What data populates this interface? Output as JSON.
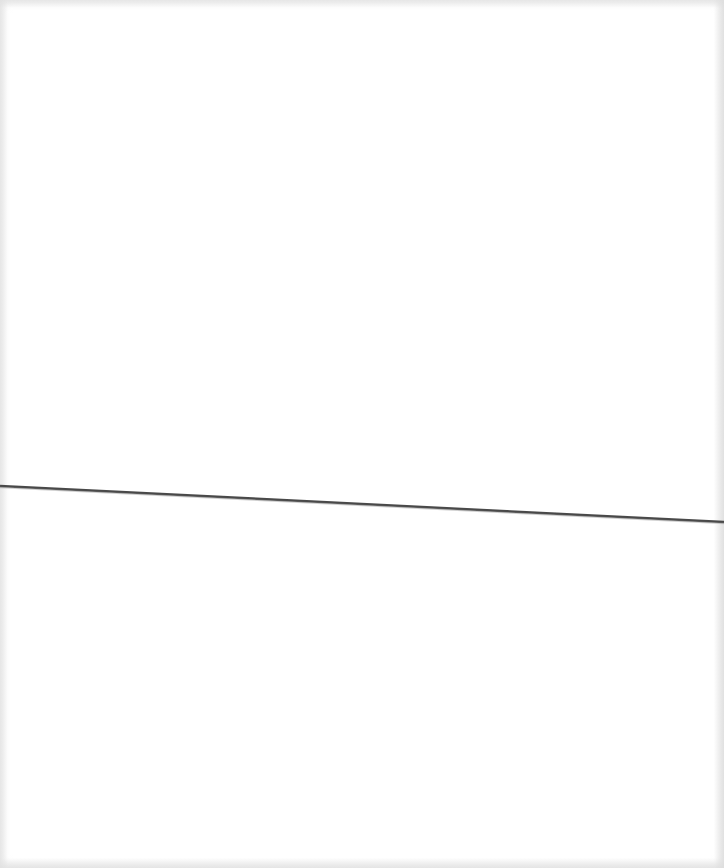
{
  "page": {
    "background_color": "#ffffff",
    "edge_shade_color": "#e1e1e1"
  },
  "rule": {
    "color": "#4a4a4a",
    "x1": 0,
    "y1": 486,
    "x2": 724,
    "y2": 522,
    "thickness": 2.5
  }
}
